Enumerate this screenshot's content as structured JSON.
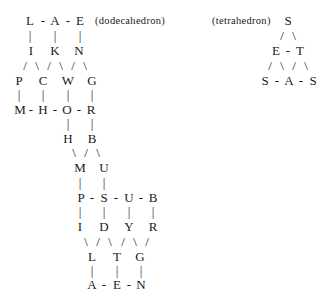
{
  "labels": {
    "dodecahedron": {
      "text": "(dodecahedron)",
      "x": 95,
      "y": 21
    },
    "tetrahedron": {
      "text": "(tetrahedron)",
      "x": 212,
      "y": 21
    }
  },
  "dodecahedron": {
    "rows": [
      {
        "y": 21,
        "glyphs": [
          [
            "L",
            30
          ],
          [
            "-",
            43
          ],
          [
            "A",
            55
          ],
          [
            "-",
            68
          ],
          [
            "E",
            80
          ]
        ]
      },
      {
        "y": 36,
        "glyphs": [
          [
            "|",
            30
          ],
          [
            "|",
            55
          ],
          [
            "|",
            80
          ]
        ]
      },
      {
        "y": 51,
        "glyphs": [
          [
            "I",
            31
          ],
          [
            "K",
            55
          ],
          [
            "N",
            79
          ]
        ]
      },
      {
        "y": 66,
        "glyphs": [
          [
            "/",
            25
          ],
          [
            "\\",
            37
          ],
          [
            "/",
            49
          ],
          [
            "\\",
            61
          ],
          [
            "/",
            73
          ],
          [
            "\\",
            85
          ]
        ]
      },
      {
        "y": 81,
        "glyphs": [
          [
            "P",
            19
          ],
          [
            "C",
            43
          ],
          [
            "W",
            68
          ],
          [
            "G",
            92
          ]
        ]
      },
      {
        "y": 95,
        "glyphs": [
          [
            "|",
            19
          ],
          [
            "|",
            43
          ],
          [
            "|",
            68
          ],
          [
            "|",
            92
          ]
        ]
      },
      {
        "y": 110,
        "glyphs": [
          [
            "M",
            20
          ],
          [
            "-",
            31
          ],
          [
            "H",
            43
          ],
          [
            "-",
            55
          ],
          [
            "O",
            67
          ],
          [
            "-",
            79
          ],
          [
            "R",
            91
          ]
        ]
      },
      {
        "y": 124,
        "glyphs": [
          [
            "|",
            68
          ],
          [
            "|",
            92
          ]
        ]
      },
      {
        "y": 139,
        "glyphs": [
          [
            "H",
            68
          ],
          [
            "B",
            92
          ]
        ]
      },
      {
        "y": 153,
        "glyphs": [
          [
            "\\",
            74
          ],
          [
            "/",
            86
          ],
          [
            "\\",
            98
          ]
        ]
      },
      {
        "y": 168,
        "glyphs": [
          [
            "M",
            80
          ],
          [
            "U",
            104
          ]
        ]
      },
      {
        "y": 183,
        "glyphs": [
          [
            "|",
            80
          ],
          [
            "|",
            104
          ]
        ]
      },
      {
        "y": 198,
        "glyphs": [
          [
            "P",
            81
          ],
          [
            "-",
            92
          ],
          [
            "S",
            104
          ],
          [
            "-",
            116
          ],
          [
            "U",
            129
          ],
          [
            "-",
            141
          ],
          [
            "B",
            153
          ]
        ]
      },
      {
        "y": 212,
        "glyphs": [
          [
            "|",
            80
          ],
          [
            "|",
            104
          ],
          [
            "|",
            129
          ],
          [
            "|",
            153
          ]
        ]
      },
      {
        "y": 227,
        "glyphs": [
          [
            "I",
            80
          ],
          [
            "D",
            104
          ],
          [
            "Y",
            129
          ],
          [
            "R",
            153
          ]
        ]
      },
      {
        "y": 242,
        "glyphs": [
          [
            "\\",
            86
          ],
          [
            "/",
            98
          ],
          [
            "\\",
            110
          ],
          [
            "/",
            123
          ],
          [
            "\\",
            135
          ],
          [
            "/",
            147
          ]
        ]
      },
      {
        "y": 257,
        "glyphs": [
          [
            "L",
            92
          ],
          [
            "T",
            117
          ],
          [
            "G",
            140
          ]
        ]
      },
      {
        "y": 271,
        "glyphs": [
          [
            "|",
            92
          ],
          [
            "|",
            117
          ],
          [
            "|",
            141
          ]
        ]
      },
      {
        "y": 285,
        "glyphs": [
          [
            "A",
            92
          ],
          [
            "-",
            104
          ],
          [
            "E",
            117
          ],
          [
            "-",
            129
          ],
          [
            "N",
            141
          ]
        ]
      }
    ]
  },
  "tetrahedron": {
    "rows": [
      {
        "y": 21,
        "glyphs": [
          [
            "S",
            288
          ]
        ]
      },
      {
        "y": 36,
        "glyphs": [
          [
            "/",
            282
          ],
          [
            "\\",
            294
          ]
        ]
      },
      {
        "y": 51,
        "glyphs": [
          [
            "E",
            276
          ],
          [
            "-",
            288
          ],
          [
            "T",
            300
          ]
        ]
      },
      {
        "y": 66,
        "glyphs": [
          [
            "/",
            270
          ],
          [
            "\\",
            282
          ],
          [
            "/",
            294
          ],
          [
            "\\",
            306
          ]
        ]
      },
      {
        "y": 81,
        "glyphs": [
          [
            "S",
            265
          ],
          [
            "-",
            277
          ],
          [
            "A",
            289
          ],
          [
            "-",
            301
          ],
          [
            "S",
            313
          ]
        ]
      }
    ]
  }
}
